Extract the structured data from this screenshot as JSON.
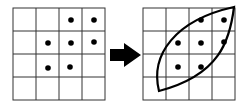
{
  "diagram": {
    "left_grid": {
      "rows": 4,
      "cols": 4,
      "dots": [
        [
          0,
          2
        ],
        [
          0,
          3
        ],
        [
          1,
          1
        ],
        [
          1,
          2
        ],
        [
          1,
          3
        ],
        [
          2,
          1
        ],
        [
          2,
          2
        ]
      ]
    },
    "arrow": {
      "direction": "right",
      "color": "#000000"
    },
    "right_grid": {
      "rows": 4,
      "cols": 4,
      "dots": [
        [
          0,
          2
        ],
        [
          0,
          3
        ],
        [
          1,
          1
        ],
        [
          1,
          2
        ],
        [
          1,
          3
        ],
        [
          2,
          1
        ],
        [
          2,
          2
        ]
      ],
      "enclosing_shape": "leaf"
    }
  }
}
